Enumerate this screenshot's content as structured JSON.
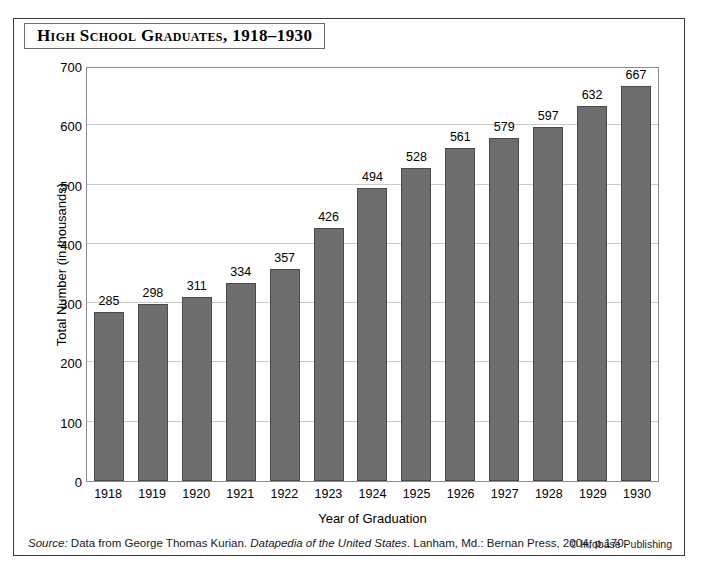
{
  "figure": {
    "title": "High School Graduates, 1918–1930",
    "source_prefix": "Source:",
    "source_text_1": " Data from George Thomas Kurian. ",
    "source_italic": "Datapedia of the United States",
    "source_text_2": ". Lanham, Md.: Bernan Press, 2004, p.170.",
    "credit": "© Infobase Publishing",
    "bar_color": "#6e6e6e",
    "grid_color": "#c9c9c9",
    "border_color": "#3a3a3a"
  },
  "chart_data": {
    "type": "bar",
    "title": "High School Graduates, 1918–1930",
    "xlabel": "Year of Graduation",
    "ylabel": "Total Number (in thousands)",
    "categories": [
      "1918",
      "1919",
      "1920",
      "1921",
      "1922",
      "1923",
      "1924",
      "1925",
      "1926",
      "1927",
      "1928",
      "1929",
      "1930"
    ],
    "values": [
      285,
      298,
      311,
      334,
      357,
      426,
      494,
      528,
      561,
      579,
      597,
      632,
      667
    ],
    "ylim": [
      0,
      700
    ],
    "yticks": [
      700,
      600,
      500,
      400,
      300,
      200,
      100,
      0
    ],
    "grid": true,
    "legend": "none"
  }
}
